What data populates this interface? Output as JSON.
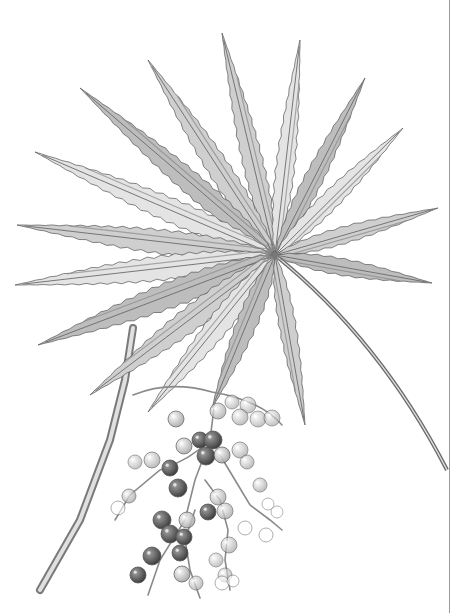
{
  "image": {
    "subject": "fan palm leaf with berry cluster",
    "style": "grayscale pencil botanical illustration",
    "background": "#ffffff",
    "ink_color": "#555555",
    "shade_light": "#d9d9d9",
    "shade_mid": "#a8a8a8",
    "shade_dark": "#5a5a5a",
    "berry_dark": "#4a4a4a",
    "berry_light": "#e6e6e6"
  },
  "leaf": {
    "hub": [
      275,
      255
    ],
    "leaflets": [
      {
        "tip": [
          222,
          33
        ],
        "w": 11
      },
      {
        "tip": [
          300,
          40
        ],
        "w": 10
      },
      {
        "tip": [
          365,
          78
        ],
        "w": 10
      },
      {
        "tip": [
          148,
          60
        ],
        "w": 12
      },
      {
        "tip": [
          403,
          128
        ],
        "w": 10
      },
      {
        "tip": [
          80,
          88
        ],
        "w": 12
      },
      {
        "tip": [
          438,
          208
        ],
        "w": 9
      },
      {
        "tip": [
          35,
          152
        ],
        "w": 13
      },
      {
        "tip": [
          432,
          283
        ],
        "w": 9
      },
      {
        "tip": [
          17,
          225
        ],
        "w": 13
      },
      {
        "tip": [
          15,
          285
        ],
        "w": 13
      },
      {
        "tip": [
          38,
          345
        ],
        "w": 14
      },
      {
        "tip": [
          90,
          395
        ],
        "w": 13
      },
      {
        "tip": [
          148,
          412
        ],
        "w": 12
      },
      {
        "tip": [
          212,
          408
        ],
        "w": 11
      },
      {
        "tip": [
          305,
          425
        ],
        "w": 9
      }
    ],
    "petiole": {
      "start": [
        275,
        255
      ],
      "control": [
        380,
        340
      ],
      "end": [
        447,
        470
      ]
    }
  },
  "branch": {
    "points": [
      [
        133,
        328
      ],
      [
        125,
        380
      ],
      [
        110,
        440
      ],
      [
        80,
        520
      ],
      [
        40,
        590
      ]
    ],
    "width": 8
  },
  "berries": [
    {
      "c": [
        176,
        419
      ],
      "r": 8,
      "t": 0.3
    },
    {
      "c": [
        218,
        411
      ],
      "r": 8,
      "t": 0.2
    },
    {
      "c": [
        232,
        402
      ],
      "r": 7,
      "t": 0.1
    },
    {
      "c": [
        248,
        405
      ],
      "r": 8,
      "t": 0.1
    },
    {
      "c": [
        240,
        417
      ],
      "r": 8,
      "t": 0.15
    },
    {
      "c": [
        258,
        419
      ],
      "r": 8,
      "t": 0.1
    },
    {
      "c": [
        272,
        418
      ],
      "r": 8,
      "t": 0.1
    },
    {
      "c": [
        184,
        446
      ],
      "r": 8,
      "t": 0.3
    },
    {
      "c": [
        200,
        440
      ],
      "r": 8,
      "t": 0.45
    },
    {
      "c": [
        213,
        440
      ],
      "r": 9,
      "t": 0.5
    },
    {
      "c": [
        206,
        456
      ],
      "r": 9,
      "t": 0.6
    },
    {
      "c": [
        222,
        455
      ],
      "r": 8,
      "t": 0.35
    },
    {
      "c": [
        240,
        450
      ],
      "r": 8,
      "t": 0.15
    },
    {
      "c": [
        247,
        462
      ],
      "r": 7,
      "t": 0.15
    },
    {
      "c": [
        152,
        460
      ],
      "r": 8,
      "t": 0.2
    },
    {
      "c": [
        135,
        462
      ],
      "r": 7,
      "t": 0.1
    },
    {
      "c": [
        170,
        468
      ],
      "r": 8,
      "t": 0.5
    },
    {
      "c": [
        178,
        488
      ],
      "r": 9,
      "t": 0.7
    },
    {
      "c": [
        260,
        485
      ],
      "r": 7,
      "t": 0.15
    },
    {
      "c": [
        129,
        496
      ],
      "r": 7,
      "t": 0.2
    },
    {
      "c": [
        118,
        508
      ],
      "r": 7,
      "t": 0.05
    },
    {
      "c": [
        218,
        497
      ],
      "r": 8,
      "t": 0.2
    },
    {
      "c": [
        208,
        512
      ],
      "r": 8,
      "t": 0.45
    },
    {
      "c": [
        225,
        511
      ],
      "r": 8,
      "t": 0.2
    },
    {
      "c": [
        268,
        504
      ],
      "r": 6,
      "t": 0.0
    },
    {
      "c": [
        277,
        512
      ],
      "r": 6,
      "t": 0.0
    },
    {
      "c": [
        162,
        520
      ],
      "r": 9,
      "t": 0.75
    },
    {
      "c": [
        170,
        534
      ],
      "r": 9,
      "t": 0.8
    },
    {
      "c": [
        184,
        537
      ],
      "r": 8,
      "t": 0.6
    },
    {
      "c": [
        187,
        520
      ],
      "r": 8,
      "t": 0.3
    },
    {
      "c": [
        245,
        528
      ],
      "r": 7,
      "t": 0.05
    },
    {
      "c": [
        266,
        535
      ],
      "r": 7,
      "t": 0.05
    },
    {
      "c": [
        229,
        545
      ],
      "r": 8,
      "t": 0.15
    },
    {
      "c": [
        152,
        556
      ],
      "r": 9,
      "t": 0.85
    },
    {
      "c": [
        180,
        553
      ],
      "r": 8,
      "t": 0.5
    },
    {
      "c": [
        216,
        560
      ],
      "r": 7,
      "t": 0.1
    },
    {
      "c": [
        225,
        575
      ],
      "r": 7,
      "t": 0.1
    },
    {
      "c": [
        138,
        575
      ],
      "r": 8,
      "t": 0.5
    },
    {
      "c": [
        182,
        574
      ],
      "r": 8,
      "t": 0.35
    },
    {
      "c": [
        196,
        583
      ],
      "r": 7,
      "t": 0.15
    },
    {
      "c": [
        222,
        583
      ],
      "r": 7,
      "t": 0.05
    },
    {
      "c": [
        233,
        581
      ],
      "r": 6,
      "t": 0.05
    }
  ],
  "stems": [
    "M133 395 Q170 380 212 392 Q260 400 282 425",
    "M215 400 L210 440 L195 480 L185 520 L160 560 L148 595",
    "M210 440 Q190 460 160 470 L130 495 L115 520",
    "M220 455 L235 480 L250 505 L270 520 L282 530",
    "M205 480 L220 500 L228 530 L225 560 L230 590",
    "M195 510 L185 540 L190 570 L200 598"
  ]
}
